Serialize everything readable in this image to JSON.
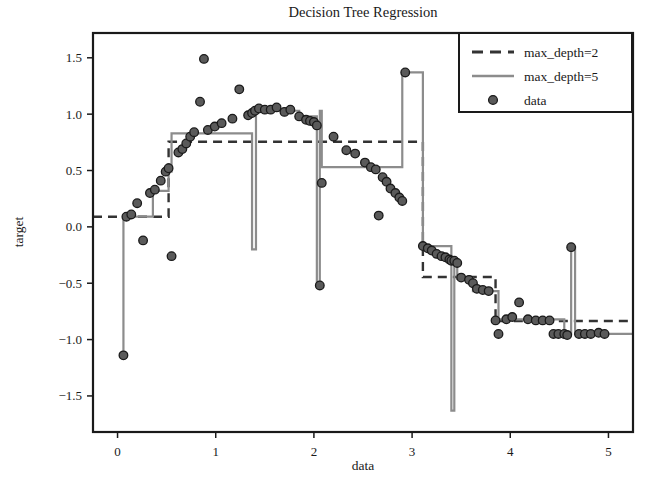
{
  "chart_data": {
    "type": "line",
    "title": "Decision Tree Regression",
    "xlabel": "data",
    "ylabel": "target",
    "xlim": [
      -0.25,
      5.25
    ],
    "ylim": [
      -1.82,
      1.72
    ],
    "xticks": [
      0,
      1,
      2,
      3,
      4,
      5
    ],
    "xticklabels": [
      "0",
      "1",
      "2",
      "3",
      "4",
      "5"
    ],
    "yticks": [
      -1.5,
      -1.0,
      -0.5,
      0.0,
      0.5,
      1.0,
      1.5
    ],
    "yticklabels": [
      "−1.5",
      "−1.0",
      "−0.5",
      "0.0",
      "0.5",
      "1.0",
      "1.5"
    ],
    "grid": false,
    "legend_position": "upper right",
    "legend_entries": [
      {
        "label": "max_depth=2",
        "style": "dashed",
        "color": "#333333"
      },
      {
        "label": "max_depth=5",
        "style": "solid",
        "color": "#8c8c8c"
      },
      {
        "label": "data",
        "style": "marker",
        "color": "#5a5a5a"
      }
    ],
    "series": [
      {
        "name": "max_depth=2",
        "type": "step",
        "style": "dashed",
        "color": "#333333",
        "linewidth": 2.4,
        "dash": "9,6",
        "x": [
          -0.25,
          0.52,
          0.52,
          3.11,
          3.11,
          3.85,
          3.85,
          5.25
        ],
        "y": [
          0.09,
          0.09,
          0.755,
          0.755,
          -0.445,
          -0.445,
          -0.835,
          -0.835
        ]
      },
      {
        "name": "max_depth=5",
        "type": "step",
        "style": "solid",
        "color": "#8c8c8c",
        "linewidth": 2.2,
        "x": [
          0.06,
          0.06,
          0.09,
          0.09,
          0.36,
          0.36,
          0.5,
          0.5,
          0.52,
          0.52,
          0.55,
          0.55,
          0.84,
          0.84,
          1.37,
          1.37,
          1.41,
          1.41,
          1.46,
          1.46,
          1.85,
          1.85,
          1.95,
          1.95,
          2.03,
          2.03,
          2.06,
          2.06,
          2.08,
          2.08,
          2.58,
          2.58,
          2.9,
          2.9,
          2.93,
          2.93,
          3.11,
          3.11,
          3.14,
          3.14,
          3.4,
          3.4,
          3.43,
          3.43,
          3.46,
          3.46,
          3.58,
          3.58,
          3.62,
          3.62,
          3.78,
          3.78,
          3.88,
          3.88,
          4.4,
          4.4,
          4.55,
          4.55,
          4.62,
          4.62,
          4.66,
          4.66,
          5.25
        ],
        "y": [
          -1.14,
          0.09,
          0.09,
          0.09,
          0.09,
          0.32,
          0.32,
          0.32,
          0.32,
          0.49,
          0.49,
          0.83,
          0.83,
          0.83,
          0.83,
          -0.2,
          -0.2,
          1.03,
          1.03,
          1.03,
          1.03,
          0.98,
          0.98,
          0.98,
          0.98,
          -0.52,
          -0.52,
          1.03,
          1.03,
          0.53,
          0.53,
          0.53,
          0.53,
          1.37,
          1.37,
          1.37,
          1.37,
          -0.17,
          -0.17,
          -0.17,
          -0.17,
          -1.63,
          -1.63,
          -0.3,
          -0.3,
          -0.46,
          -0.46,
          -0.46,
          -0.46,
          -0.57,
          -0.57,
          -0.57,
          -0.57,
          -0.82,
          -0.82,
          -0.82,
          -0.82,
          -0.95,
          -0.95,
          -0.18,
          -0.18,
          -0.95,
          -0.95
        ]
      }
    ],
    "scatter": {
      "name": "data",
      "color": "#5a5a5a",
      "edgecolor": "#1a1a1a",
      "size": 6.2,
      "points": [
        [
          0.06,
          -1.14
        ],
        [
          0.09,
          0.09
        ],
        [
          0.14,
          0.11
        ],
        [
          0.2,
          0.21
        ],
        [
          0.26,
          -0.12
        ],
        [
          0.33,
          0.3
        ],
        [
          0.38,
          0.33
        ],
        [
          0.44,
          0.41
        ],
        [
          0.49,
          0.49
        ],
        [
          0.52,
          0.52
        ],
        [
          0.55,
          -0.26
        ],
        [
          0.62,
          0.66
        ],
        [
          0.66,
          0.69
        ],
        [
          0.7,
          0.74
        ],
        [
          0.74,
          0.8
        ],
        [
          0.78,
          0.84
        ],
        [
          0.84,
          1.11
        ],
        [
          0.88,
          1.49
        ],
        [
          0.92,
          0.86
        ],
        [
          0.99,
          0.89
        ],
        [
          1.06,
          0.92
        ],
        [
          1.17,
          0.96
        ],
        [
          1.24,
          1.22
        ],
        [
          1.33,
          0.99
        ],
        [
          1.37,
          1.01
        ],
        [
          1.4,
          1.03
        ],
        [
          1.44,
          1.05
        ],
        [
          1.5,
          1.04
        ],
        [
          1.56,
          1.04
        ],
        [
          1.62,
          1.06
        ],
        [
          1.7,
          1.02
        ],
        [
          1.76,
          1.04
        ],
        [
          1.85,
          0.98
        ],
        [
          1.92,
          0.95
        ],
        [
          1.96,
          0.94
        ],
        [
          2.0,
          0.93
        ],
        [
          2.03,
          0.9
        ],
        [
          2.06,
          -0.52
        ],
        [
          2.08,
          0.39
        ],
        [
          2.2,
          0.8
        ],
        [
          2.33,
          0.68
        ],
        [
          2.42,
          0.65
        ],
        [
          2.52,
          0.57
        ],
        [
          2.58,
          0.53
        ],
        [
          2.63,
          0.51
        ],
        [
          2.66,
          0.1
        ],
        [
          2.7,
          0.44
        ],
        [
          2.74,
          0.4
        ],
        [
          2.78,
          0.34
        ],
        [
          2.83,
          0.3
        ],
        [
          2.87,
          0.26
        ],
        [
          2.9,
          0.23
        ],
        [
          2.93,
          1.37
        ],
        [
          3.11,
          -0.17
        ],
        [
          3.16,
          -0.19
        ],
        [
          3.2,
          -0.21
        ],
        [
          3.25,
          -0.24
        ],
        [
          3.3,
          -0.26
        ],
        [
          3.34,
          -0.27
        ],
        [
          3.38,
          -0.29
        ],
        [
          3.4,
          -0.3
        ],
        [
          3.43,
          -0.3
        ],
        [
          3.46,
          -0.32
        ],
        [
          3.5,
          -0.45
        ],
        [
          3.58,
          -0.47
        ],
        [
          3.62,
          -0.5
        ],
        [
          3.66,
          -0.55
        ],
        [
          3.72,
          -0.56
        ],
        [
          3.78,
          -0.57
        ],
        [
          3.85,
          -0.83
        ],
        [
          3.88,
          -0.95
        ],
        [
          3.96,
          -0.82
        ],
        [
          4.02,
          -0.8
        ],
        [
          4.09,
          -0.67
        ],
        [
          4.18,
          -0.82
        ],
        [
          4.26,
          -0.83
        ],
        [
          4.33,
          -0.83
        ],
        [
          4.4,
          -0.83
        ],
        [
          4.44,
          -0.95
        ],
        [
          4.49,
          -0.95
        ],
        [
          4.55,
          -0.95
        ],
        [
          4.58,
          -0.96
        ],
        [
          4.62,
          -0.18
        ],
        [
          4.7,
          -0.95
        ],
        [
          4.76,
          -0.95
        ],
        [
          4.82,
          -0.95
        ],
        [
          4.9,
          -0.94
        ],
        [
          4.96,
          -0.95
        ]
      ]
    }
  }
}
